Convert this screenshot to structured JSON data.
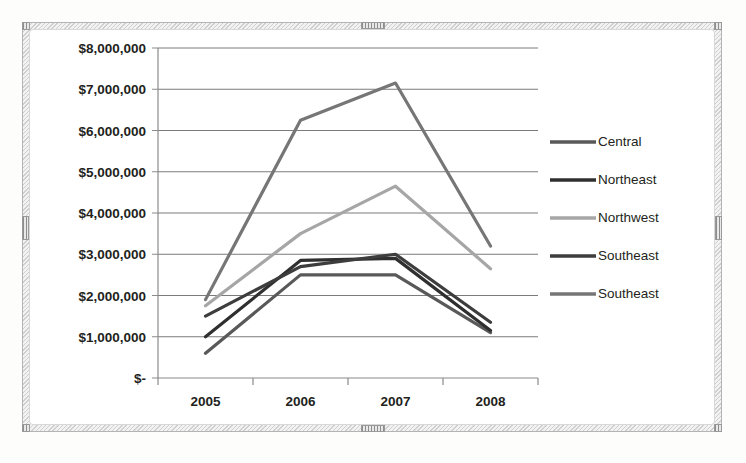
{
  "chart_data": {
    "type": "line",
    "title": "",
    "subtitle": "",
    "xlabel": "",
    "ylabel": "",
    "categories": [
      "2005",
      "2006",
      "2007",
      "2008"
    ],
    "x_tick_labels": [
      "2005",
      "2006",
      "2007",
      "2008"
    ],
    "y_tick_labels": [
      "$8,000,000",
      "$7,000,000",
      "$6,000,000",
      "$5,000,000",
      "$4,000,000",
      "$3,000,000",
      "$2,000,000",
      "$1,000,000",
      "$-"
    ],
    "y_tick_values": [
      8000000,
      7000000,
      6000000,
      5000000,
      4000000,
      3000000,
      2000000,
      1000000,
      0
    ],
    "ylim": [
      0,
      8000000
    ],
    "y_tick_interval": 1000000,
    "grid": true,
    "grid_axis": "y",
    "legend_position": "right",
    "series": [
      {
        "name": "Central",
        "color": "#595959",
        "values": [
          600000,
          2500000,
          2500000,
          1100000
        ]
      },
      {
        "name": "Northeast",
        "color": "#2f2f2f",
        "values": [
          1000000,
          2850000,
          2900000,
          1150000
        ]
      },
      {
        "name": "Northwest",
        "color": "#a6a6a6",
        "values": [
          1750000,
          3500000,
          4650000,
          2650000
        ]
      },
      {
        "name": "Southeast",
        "color": "#3d3d3d",
        "values": [
          1500000,
          2700000,
          3000000,
          1350000
        ]
      },
      {
        "name": "Southeast",
        "color": "#767676",
        "values": [
          1900000,
          6250000,
          7150000,
          3200000
        ]
      }
    ],
    "legend_entries": [
      "Central",
      "Northeast",
      "Northwest",
      "Southeast",
      "Southeast"
    ]
  },
  "colors": {
    "plot_background": "#ffffff",
    "gridline": "#7b7b7b",
    "axis": "#8a8a8a",
    "text": "#231f20",
    "frame": "#cfcfcf"
  }
}
